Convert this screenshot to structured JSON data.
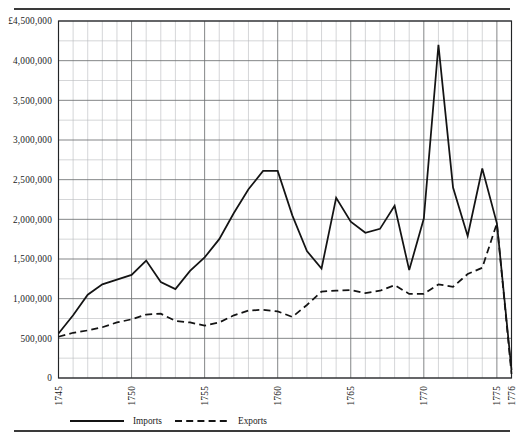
{
  "figure": {
    "top_rule": "horizontal-rule",
    "bottom_rule": "horizontal-rule"
  },
  "chart_data": {
    "type": "line",
    "title": "",
    "subtitle": "",
    "xlabel": "",
    "ylabel": "",
    "currency_symbol": "£",
    "xlim": [
      1745,
      1776
    ],
    "ylim": [
      0,
      4500000
    ],
    "ytick_step": 500000,
    "grid": true,
    "grid_minor_interval_years": 1,
    "grid_major_interval_years": 5,
    "legend_position": "below-axis-left",
    "x": [
      1745,
      1746,
      1747,
      1748,
      1749,
      1750,
      1751,
      1752,
      1753,
      1754,
      1755,
      1756,
      1757,
      1758,
      1759,
      1760,
      1761,
      1762,
      1763,
      1764,
      1765,
      1766,
      1767,
      1768,
      1769,
      1770,
      1771,
      1772,
      1773,
      1774,
      1775,
      1776
    ],
    "xtick_labels": [
      "1745",
      "1750",
      "1755",
      "1760",
      "1765",
      "1770",
      "1775",
      "1776"
    ],
    "xtick_values": [
      1745,
      1750,
      1755,
      1760,
      1765,
      1770,
      1775,
      1776
    ],
    "ytick_labels": [
      "£4,500,000",
      "4,000,000",
      "3,500,000",
      "3,000,000",
      "2,500,000",
      "2,000,000",
      "1,500,000",
      "1,000,000",
      "500,000",
      "0"
    ],
    "ytick_values": [
      4500000,
      4000000,
      3500000,
      3000000,
      2500000,
      2000000,
      1500000,
      1000000,
      500000,
      0
    ],
    "series": [
      {
        "name": "Imports",
        "style": "solid",
        "color": "#141414",
        "values": [
          560000,
          790000,
          1050000,
          1180000,
          1240000,
          1300000,
          1480000,
          1210000,
          1120000,
          1350000,
          1520000,
          1750000,
          2080000,
          2380000,
          2610000,
          2610000,
          2050000,
          1600000,
          1380000,
          2270000,
          1970000,
          1830000,
          1880000,
          2170000,
          1360000,
          2010000,
          4200000,
          2400000,
          1790000,
          2640000,
          1950000,
          100000
        ]
      },
      {
        "name": "Exports",
        "style": "dashed",
        "color": "#141414",
        "values": [
          520000,
          570000,
          600000,
          640000,
          700000,
          740000,
          800000,
          810000,
          720000,
          700000,
          660000,
          700000,
          790000,
          850000,
          860000,
          840000,
          770000,
          920000,
          1090000,
          1100000,
          1110000,
          1070000,
          1100000,
          1170000,
          1060000,
          1060000,
          1180000,
          1150000,
          1310000,
          1390000,
          1950000,
          50000
        ]
      }
    ],
    "legend": [
      {
        "label": "Imports",
        "style": "solid"
      },
      {
        "label": "Exports",
        "style": "dashed"
      }
    ]
  }
}
